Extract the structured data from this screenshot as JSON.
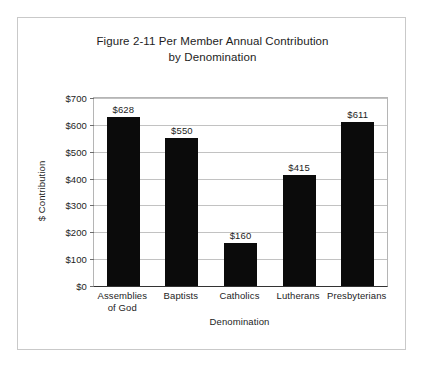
{
  "chart_data": {
    "type": "bar",
    "title": "Figure 2-11 Per Member Annual Contribution by Denomination",
    "title_lines": [
      "Figure 2-11 Per Member Annual Contribution",
      "by Denomination"
    ],
    "xlabel": "Denomination",
    "ylabel": "$ Contribution",
    "categories": [
      "Assemblies of God",
      "Baptists",
      "Catholics",
      "Lutherans",
      "Presbyterians"
    ],
    "category_lines": [
      [
        "Assemblies",
        "of God"
      ],
      [
        "Baptists"
      ],
      [
        "Catholics"
      ],
      [
        "Lutherans"
      ],
      [
        "Presbyterians"
      ]
    ],
    "values": [
      628,
      550,
      160,
      415,
      611
    ],
    "value_labels": [
      "$628",
      "$550",
      "$160",
      "$415",
      "$611"
    ],
    "ylim": [
      0,
      700
    ],
    "ytick_values": [
      0,
      100,
      200,
      300,
      400,
      500,
      600,
      700
    ],
    "ytick_labels": [
      "$0",
      "$100",
      "$200",
      "$300",
      "$400",
      "$500",
      "$600",
      "$700"
    ],
    "grid": true,
    "legend": false,
    "bar_color": "#0b0b0b",
    "grid_color": "#c2c2c2",
    "axis_color": "#333333",
    "frame_color": "#c9c9c9",
    "background": "#ffffff"
  }
}
